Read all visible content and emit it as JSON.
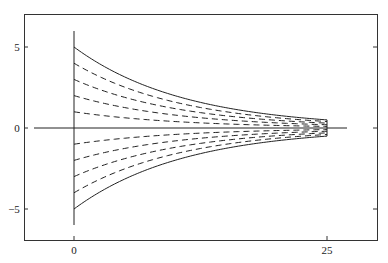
{
  "chart_data": {
    "type": "line",
    "title": "",
    "xlabel": "",
    "ylabel": "",
    "xlim": [
      -5,
      30
    ],
    "ylim": [
      -7,
      7
    ],
    "x_ticks": [
      "0",
      "25"
    ],
    "y_ticks": [
      "5",
      "0",
      "-5"
    ],
    "grid": false,
    "legend": null,
    "x_range_curves": [
      0,
      25
    ],
    "series": [
      {
        "name": "y=5·e^(-x/10.86)",
        "style": "solid",
        "y0": 5,
        "y_end": 0.5
      },
      {
        "name": "y=4·e^(-x/10.86)",
        "style": "dashed",
        "y0": 4,
        "y_end": 0.4
      },
      {
        "name": "y=3·e^(-x/10.86)",
        "style": "dashed",
        "y0": 3,
        "y_end": 0.3
      },
      {
        "name": "y=2·e^(-x/10.86)",
        "style": "dashed",
        "y0": 2,
        "y_end": 0.2
      },
      {
        "name": "y=1·e^(-x/10.86)",
        "style": "dashed",
        "y0": 1,
        "y_end": 0.1
      },
      {
        "name": "y=-1·e^(-x/10.86)",
        "style": "dashed",
        "y0": -1,
        "y_end": -0.1
      },
      {
        "name": "y=-2·e^(-x/10.86)",
        "style": "dashed",
        "y0": -2,
        "y_end": -0.2
      },
      {
        "name": "y=-3·e^(-x/10.86)",
        "style": "dashed",
        "y0": -3,
        "y_end": -0.3
      },
      {
        "name": "y=-4·e^(-x/10.86)",
        "style": "dashed",
        "y0": -4,
        "y_end": -0.4
      },
      {
        "name": "y=-5·e^(-x/10.86)",
        "style": "solid",
        "y0": -5,
        "y_end": -0.5
      }
    ],
    "annotations": [
      "vertical line at x=0 from y=-6 to y=6",
      "horizontal axis line y=0",
      "vertical end line at x=25"
    ]
  }
}
